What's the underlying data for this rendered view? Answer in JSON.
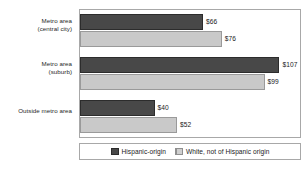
{
  "chart_data": {
    "type": "bar",
    "orientation": "horizontal",
    "title": "",
    "xlabel": "",
    "ylabel": "",
    "grid": false,
    "legend_position": "bottom",
    "xlim": [
      0,
      118
    ],
    "value_prefix": "$",
    "categories": [
      "Metro area (central city)",
      "Metro area (suburb)",
      "Outside metro area"
    ],
    "category_lines": [
      [
        "Metro area",
        "(central city)"
      ],
      [
        "Metro area",
        "(suburb)"
      ],
      [
        "Outside metro area",
        ""
      ]
    ],
    "series": [
      {
        "name": "Hispanic-origin",
        "color": "#484848",
        "values": [
          66,
          107,
          40
        ],
        "labels": [
          "$66",
          "$107",
          "$40"
        ]
      },
      {
        "name": "White, not of Hispanic origin",
        "color": "#c9c9c9",
        "values": [
          76,
          99,
          52
        ],
        "labels": [
          "$76",
          "$99",
          "$52"
        ]
      }
    ]
  },
  "legend": {
    "items": [
      {
        "label": "Hispanic-origin"
      },
      {
        "label": "White, not of Hispanic origin"
      }
    ]
  }
}
